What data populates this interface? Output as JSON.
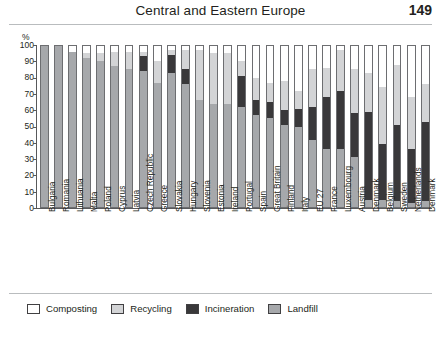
{
  "header": {
    "title": "Central and Eastern Europe",
    "page_number": "149"
  },
  "legend": {
    "items": [
      {
        "label": "Composting",
        "color": "#ffffff",
        "key": "composting"
      },
      {
        "label": "Recycling",
        "color": "#d3d4d6",
        "key": "recycling"
      },
      {
        "label": "Incineration",
        "color": "#39383a",
        "key": "incineration"
      },
      {
        "label": "Landfill",
        "color": "#a6a8ab",
        "key": "landfill"
      }
    ]
  },
  "chart_data": {
    "type": "bar",
    "title": "",
    "xlabel": "",
    "ylabel": "%",
    "ylim": [
      0,
      100
    ],
    "yticks": [
      0,
      10,
      20,
      30,
      40,
      50,
      60,
      70,
      80,
      90,
      100
    ],
    "grid": false,
    "stacked": true,
    "stack_order": [
      "landfill",
      "incineration",
      "recycling",
      "composting"
    ],
    "legend_position": "bottom",
    "categories": [
      "Bulgaria",
      "Romania",
      "Lithuania",
      "Malta",
      "Poland",
      "Cyprus",
      "Latvia",
      "Czech Republic",
      "Greece",
      "Slovakia",
      "Hungary",
      "Slovenia",
      "Estonia",
      "Ireland",
      "Portugal",
      "Spain",
      "Great Britain",
      "Finland",
      "Italy",
      "EU 27",
      "France",
      "Luxembourg",
      "Austria",
      "Denmark",
      "Belgium",
      "Sweden",
      "Netherlands",
      "Denmark"
    ],
    "series": [
      {
        "name": "Landfill",
        "color": "#a6a8ab",
        "values": [
          100,
          100,
          96,
          92,
          90,
          87,
          85,
          84,
          77,
          83,
          76,
          66,
          64,
          64,
          62,
          57,
          55,
          51,
          50,
          42,
          36,
          36,
          31,
          5,
          5,
          4,
          3,
          4
        ]
      },
      {
        "name": "Incineration",
        "color": "#39383a",
        "values": [
          0,
          0,
          0,
          0,
          0,
          0,
          0,
          9,
          0,
          11,
          9,
          0,
          0,
          0,
          19,
          9,
          10,
          9,
          11,
          20,
          32,
          36,
          27,
          54,
          34,
          47,
          33,
          49
        ]
      },
      {
        "name": "Recycling",
        "color": "#d3d4d6",
        "values": [
          0,
          0,
          0,
          3,
          5,
          9,
          11,
          3,
          13,
          3,
          12,
          31,
          31,
          31,
          9,
          14,
          12,
          18,
          11,
          23,
          18,
          25,
          27,
          24,
          35,
          37,
          32,
          23
        ]
      },
      {
        "name": "Composting",
        "color": "#ffffff",
        "values": [
          0,
          0,
          4,
          5,
          5,
          4,
          4,
          4,
          10,
          3,
          3,
          3,
          5,
          5,
          10,
          20,
          23,
          22,
          28,
          15,
          14,
          3,
          15,
          17,
          26,
          12,
          32,
          24
        ]
      }
    ]
  }
}
